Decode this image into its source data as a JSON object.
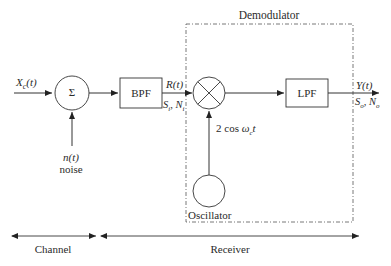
{
  "diagram": {
    "type": "block-diagram",
    "title": "Demodulator",
    "input": {
      "signal": "X_c(t)",
      "display": "X",
      "sub": "c",
      "arg": "(t)"
    },
    "adder": {
      "symbol": "Σ"
    },
    "noise": {
      "signal": "n(t)",
      "label": "noise"
    },
    "bpf": {
      "label": "BPF",
      "output_signal": "R(t)",
      "output_params": "S_i, N_i"
    },
    "mixer": {
      "symbol": "×"
    },
    "oscillator": {
      "label": "Oscillator",
      "signal": "2 cos ω_c t"
    },
    "lpf": {
      "label": "LPF",
      "output_signal": "Y(t)",
      "output_params": "S_o, N_o"
    },
    "sections": [
      {
        "label": "Channel"
      },
      {
        "label": "Receiver"
      }
    ]
  },
  "labels": {
    "demodulator": "Demodulator",
    "xc_main": "X",
    "xc_sub": "c",
    "xc_arg": "(t)",
    "sigma": "Σ",
    "nt": "n(t)",
    "noise": "noise",
    "bpf": "BPF",
    "rt": "R(t)",
    "si_main": "S",
    "si_sub": "i",
    "ni_main": "N",
    "ni_sub": "i",
    "osc_signal_pre": "2 cos ",
    "osc_signal_omega": "ω",
    "osc_signal_sub": "c",
    "osc_signal_post": "t",
    "oscillator": "Oscillator",
    "lpf": "LPF",
    "yt": "Y(t)",
    "so_main": "S",
    "so_sub": "o",
    "no_main": "N",
    "no_sub": "o",
    "channel": "Channel",
    "receiver": "Receiver"
  }
}
